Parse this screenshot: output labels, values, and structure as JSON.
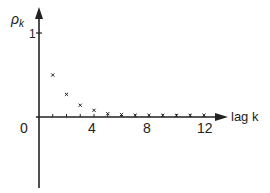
{
  "chart_data": {
    "type": "scatter",
    "title": "",
    "xlabel": "lag k",
    "ylabel": "ρk",
    "ylabel_main": "ρ",
    "ylabel_sub": "k",
    "origin_label": "0",
    "x_ticks": [
      "4",
      "8",
      "12"
    ],
    "y_ticks": [
      "1"
    ],
    "x": [
      1,
      2,
      3,
      4,
      5,
      6,
      7,
      8,
      9,
      10,
      11,
      12
    ],
    "values": [
      0.5,
      0.27,
      0.14,
      0.08,
      0.04,
      0.03,
      0.02,
      0.02,
      0.02,
      0.02,
      0.02,
      0.02
    ],
    "xlim": [
      0,
      13
    ],
    "ylim": [
      -0.8,
      1.2
    ],
    "grid": false,
    "marker": "x"
  }
}
